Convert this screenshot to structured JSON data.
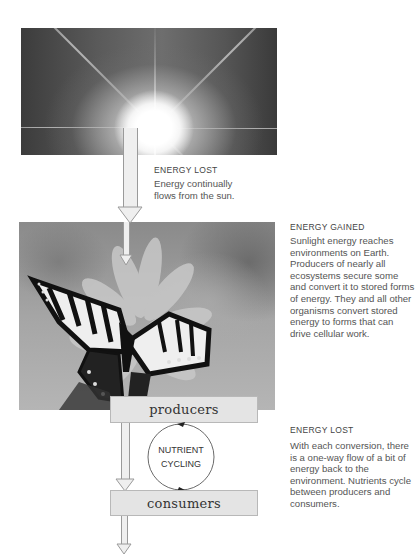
{
  "diagram": {
    "sun_image": {
      "subject": "sun-with-rays-photo"
    },
    "butterfly_image": {
      "subject": "swallowtail-butterfly-on-flower-photo"
    },
    "annotations": [
      {
        "heading": "ENERGY LOST",
        "body": "Energy continually flows from the sun."
      },
      {
        "heading": "ENERGY GAINED",
        "body": "Sunlight energy reaches environments on Earth. Producers of nearly all ecosystems secure some and convert it to stored forms of energy. They and all other organisms convert stored energy to forms that can drive cellular work."
      },
      {
        "heading": "ENERGY LOST",
        "body": "With each conversion, there is a one-way flow of a bit of energy back to the environment. Nutrients cycle between producers and consumers."
      }
    ],
    "boxes": {
      "producers": "producers",
      "consumers": "consumers"
    },
    "cycle": {
      "line1": "NUTRIENT",
      "line2": "CYCLING"
    },
    "colors": {
      "arrow_fill": "#efefef",
      "arrow_stroke": "#9a9a9a",
      "box_fill": "#e4e4e4",
      "text": "#555555"
    }
  }
}
